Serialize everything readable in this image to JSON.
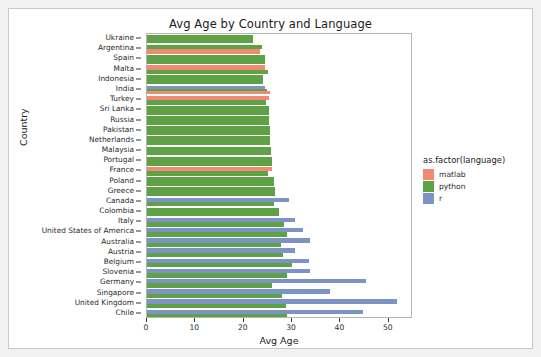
{
  "chart_data": {
    "type": "bar",
    "orientation": "horizontal",
    "grouped": true,
    "title": "Avg Age by Country and Language",
    "xlabel": "Avg Age",
    "ylabel": "Country",
    "xlim": [
      0,
      55
    ],
    "xticks": [
      0,
      10,
      20,
      30,
      40,
      50
    ],
    "xtick_labels": [
      "0",
      "10",
      "20",
      "30",
      "40",
      "50"
    ],
    "grid": false,
    "legend_title": "as.factor(language)",
    "legend_position": "right",
    "legend_entries": [
      "matlab",
      "python",
      "r"
    ],
    "colors": {
      "matlab": "#F08A72",
      "python": "#5FA246",
      "r": "#7B94C4"
    },
    "categories": [
      "Ukraine",
      "Argentina",
      "Spain",
      "Malta",
      "Indonesia",
      "India",
      "Turkey",
      "Sri Lanka",
      "Russia",
      "Pakistan",
      "Netherlands",
      "Malaysia",
      "Portugal",
      "France",
      "Poland",
      "Greece",
      "Canada",
      "Colombia",
      "Italy",
      "United States of America",
      "Australia",
      "Austria",
      "Belgium",
      "Slovenia",
      "Germany",
      "Singapore",
      "United Kingdom",
      "Chile"
    ],
    "series": [
      {
        "name": "matlab",
        "values": [
          null,
          23.4,
          null,
          24.3,
          null,
          25.5,
          25.2,
          null,
          null,
          null,
          null,
          null,
          null,
          25.8,
          null,
          null,
          null,
          null,
          null,
          null,
          null,
          null,
          null,
          null,
          null,
          null,
          null,
          null
        ]
      },
      {
        "name": "python",
        "values": [
          21.9,
          23.8,
          24.4,
          25.0,
          24.0,
          24.9,
          24.6,
          25.2,
          25.2,
          25.4,
          25.5,
          25.6,
          25.9,
          25.0,
          26.2,
          26.4,
          26.2,
          27.2,
          28.3,
          29.0,
          27.8,
          28.2,
          30.0,
          29.0,
          25.8,
          28.0,
          28.7,
          28.9
        ]
      },
      {
        "name": "r",
        "values": [
          null,
          null,
          null,
          null,
          null,
          24.5,
          null,
          null,
          null,
          null,
          null,
          null,
          null,
          null,
          null,
          null,
          29.4,
          null,
          30.5,
          32.2,
          33.8,
          30.5,
          33.4,
          33.8,
          45.2,
          37.9,
          51.7,
          44.6
        ]
      }
    ],
    "rows": [
      {
        "country": "Ukraine",
        "bars": [
          {
            "lang": "python",
            "value": 21.9
          }
        ]
      },
      {
        "country": "Argentina",
        "bars": [
          {
            "lang": "python",
            "value": 23.8
          },
          {
            "lang": "matlab",
            "value": 23.4
          }
        ]
      },
      {
        "country": "Spain",
        "bars": [
          {
            "lang": "python",
            "value": 24.4
          }
        ]
      },
      {
        "country": "Malta",
        "bars": [
          {
            "lang": "matlab",
            "value": 24.3
          },
          {
            "lang": "python",
            "value": 25.0
          }
        ]
      },
      {
        "country": "Indonesia",
        "bars": [
          {
            "lang": "python",
            "value": 24.0
          }
        ]
      },
      {
        "country": "India",
        "bars": [
          {
            "lang": "r",
            "value": 24.5
          },
          {
            "lang": "python",
            "value": 24.9
          },
          {
            "lang": "matlab",
            "value": 25.5
          }
        ]
      },
      {
        "country": "Turkey",
        "bars": [
          {
            "lang": "matlab",
            "value": 25.2
          },
          {
            "lang": "python",
            "value": 24.6
          }
        ]
      },
      {
        "country": "Sri Lanka",
        "bars": [
          {
            "lang": "python",
            "value": 25.2
          }
        ]
      },
      {
        "country": "Russia",
        "bars": [
          {
            "lang": "python",
            "value": 25.2
          }
        ]
      },
      {
        "country": "Pakistan",
        "bars": [
          {
            "lang": "python",
            "value": 25.4
          }
        ]
      },
      {
        "country": "Netherlands",
        "bars": [
          {
            "lang": "python",
            "value": 25.5
          }
        ]
      },
      {
        "country": "Malaysia",
        "bars": [
          {
            "lang": "python",
            "value": 25.6
          }
        ]
      },
      {
        "country": "Portugal",
        "bars": [
          {
            "lang": "python",
            "value": 25.9
          }
        ]
      },
      {
        "country": "France",
        "bars": [
          {
            "lang": "matlab",
            "value": 25.8
          },
          {
            "lang": "python",
            "value": 25.0
          }
        ]
      },
      {
        "country": "Poland",
        "bars": [
          {
            "lang": "python",
            "value": 26.2
          }
        ]
      },
      {
        "country": "Greece",
        "bars": [
          {
            "lang": "python",
            "value": 26.4
          }
        ]
      },
      {
        "country": "Canada",
        "bars": [
          {
            "lang": "r",
            "value": 29.4
          },
          {
            "lang": "python",
            "value": 26.2
          }
        ]
      },
      {
        "country": "Colombia",
        "bars": [
          {
            "lang": "python",
            "value": 27.2
          }
        ]
      },
      {
        "country": "Italy",
        "bars": [
          {
            "lang": "r",
            "value": 30.5
          },
          {
            "lang": "python",
            "value": 28.3
          }
        ]
      },
      {
        "country": "United States of America",
        "bars": [
          {
            "lang": "r",
            "value": 32.2
          },
          {
            "lang": "python",
            "value": 29.0
          }
        ]
      },
      {
        "country": "Australia",
        "bars": [
          {
            "lang": "r",
            "value": 33.8
          },
          {
            "lang": "python",
            "value": 27.8
          }
        ]
      },
      {
        "country": "Austria",
        "bars": [
          {
            "lang": "r",
            "value": 30.5
          },
          {
            "lang": "python",
            "value": 28.2
          }
        ]
      },
      {
        "country": "Belgium",
        "bars": [
          {
            "lang": "r",
            "value": 33.4
          },
          {
            "lang": "python",
            "value": 30.0
          }
        ]
      },
      {
        "country": "Slovenia",
        "bars": [
          {
            "lang": "r",
            "value": 33.8
          },
          {
            "lang": "python",
            "value": 29.0
          }
        ]
      },
      {
        "country": "Germany",
        "bars": [
          {
            "lang": "r",
            "value": 45.2
          },
          {
            "lang": "python",
            "value": 25.8
          }
        ]
      },
      {
        "country": "Singapore",
        "bars": [
          {
            "lang": "r",
            "value": 37.9
          },
          {
            "lang": "python",
            "value": 28.0
          }
        ]
      },
      {
        "country": "United Kingdom",
        "bars": [
          {
            "lang": "r",
            "value": 51.7
          },
          {
            "lang": "python",
            "value": 28.7
          }
        ]
      },
      {
        "country": "Chile",
        "bars": [
          {
            "lang": "r",
            "value": 44.6
          },
          {
            "lang": "python",
            "value": 28.9
          }
        ]
      }
    ]
  }
}
